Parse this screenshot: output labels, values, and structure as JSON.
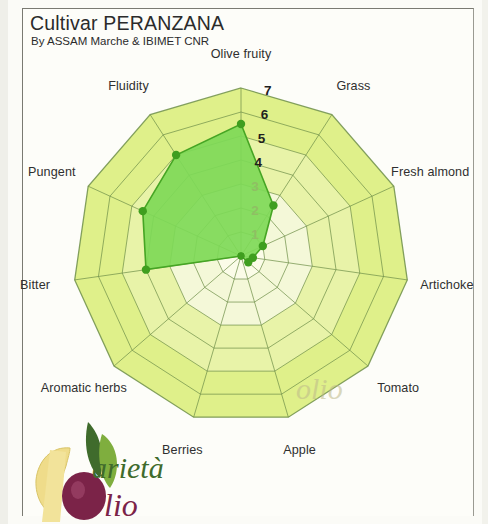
{
  "header": {
    "title": "Cultivar PERANZANA",
    "subtitle": "By ASSAM Marche & IBIMET CNR"
  },
  "logo": {
    "word_top": "arietà",
    "word_bottom": "lio",
    "initial_top": "V",
    "initial_bottom": "O"
  },
  "watermark": {
    "text": "olio"
  },
  "colors": {
    "data_fill": "#7ed957",
    "data_stroke": "#46a524",
    "data_point": "#3f9e1f",
    "web_outer_band": "#dff08a",
    "web_mid_band": "#e8f3a8",
    "web_inner_band": "#f4f8d8",
    "web_core": "#fbfce8",
    "grid_line": "#6f8f4a",
    "text": "#2f2f2f"
  },
  "chart_data": {
    "type": "radar",
    "title": "Cultivar PERANZANA",
    "subtitle": "By ASSAM Marche & IBIMET CNR",
    "categories": [
      "Olive fruity",
      "Grass",
      "Fresh almond",
      "Artichoke",
      "Tomato",
      "Apple",
      "Berries",
      "Aromatic herbs",
      "Bitter",
      "Pungent",
      "Fluidity"
    ],
    "axis_labels": [
      "Olive fruity",
      "Grass",
      "Fresh almond",
      "Artichoke",
      "Tomato",
      "Apple",
      "Berries",
      "Aromatic herbs",
      "Bitter",
      "Pungent",
      "Fluidity"
    ],
    "values": [
      5.5,
      2.5,
      1.0,
      0.5,
      0.4,
      0.0,
      0.0,
      0.0,
      4.0,
      4.5,
      5.0
    ],
    "series": [
      {
        "name": "PERANZANA",
        "values": [
          5.5,
          2.5,
          1.0,
          0.5,
          0.4,
          0.0,
          0.0,
          0.0,
          4.0,
          4.5,
          5.0
        ]
      }
    ],
    "rlim": [
      0,
      7
    ],
    "tick_values": [
      1,
      2,
      3,
      4,
      5,
      6,
      7
    ],
    "tick_labels": [
      "1",
      "2",
      "3",
      "4",
      "5",
      "6",
      "7"
    ],
    "tick_axis": "Olive fruity",
    "grid": true,
    "legend": "none",
    "xlabel": "",
    "ylabel": ""
  }
}
